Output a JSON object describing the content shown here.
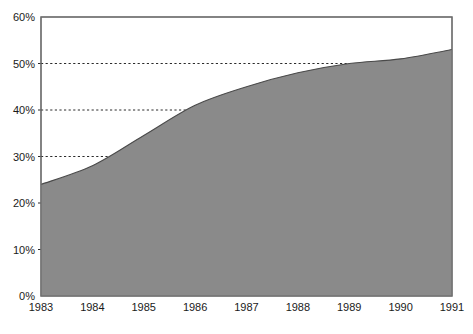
{
  "chart_data": {
    "type": "area",
    "title": "",
    "subtitle": "",
    "xlabel": "",
    "ylabel": "",
    "x": [
      1983,
      1984,
      1985,
      1986,
      1987,
      1988,
      1989,
      1990,
      1991
    ],
    "categories": [
      "1983",
      "1984",
      "1985",
      "1986",
      "1987",
      "1988",
      "1989",
      "1990",
      "1991"
    ],
    "values": [
      24,
      28,
      34.5,
      41,
      45,
      48,
      50,
      51,
      53
    ],
    "series": [
      {
        "name": "",
        "values": [
          24,
          28,
          34.5,
          41,
          45,
          48,
          50,
          51,
          53
        ]
      }
    ],
    "ylim": [
      0,
      60
    ],
    "xlim": [
      1983,
      1991
    ],
    "yticks": [
      0,
      10,
      20,
      30,
      40,
      50,
      60
    ],
    "ytick_labels": [
      "0%",
      "10%",
      "20%",
      "30%",
      "40%",
      "50%",
      "60%"
    ],
    "xticks": [
      1983,
      1984,
      1985,
      1986,
      1987,
      1988,
      1989,
      1990,
      1991
    ],
    "xtick_labels": [
      "1983",
      "1984",
      "1985",
      "1986",
      "1987",
      "1988",
      "1989",
      "1990",
      "1991"
    ],
    "grid": "horizontal-dashed-partial",
    "gridlines_at": [
      30,
      40,
      50
    ],
    "legend": "none",
    "legend_position": "none",
    "annotations": [],
    "colors": {
      "area_fill": "#8a8a8a",
      "area_line": "#4a4a4a",
      "gridline": "#2b2b2b",
      "frame": "#6d6d6d",
      "text": "#1a1a1a",
      "background": "#ffffff"
    }
  }
}
